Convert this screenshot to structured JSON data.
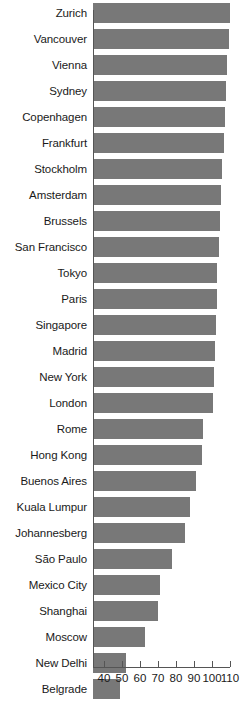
{
  "chart_data": {
    "type": "bar",
    "orientation": "horizontal",
    "title": "",
    "subtitle": "",
    "xlabel": "",
    "ylabel": "",
    "xlim": [
      40,
      110
    ],
    "xticks": [
      40,
      50,
      60,
      70,
      80,
      90,
      100,
      110
    ],
    "xtick_labels": [
      "40",
      "50",
      "60",
      "70",
      "80",
      "90",
      "100",
      "110"
    ],
    "grid": false,
    "legend": null,
    "bar_color": "#787878",
    "axis_color": "#555555",
    "categories": [
      "Zurich",
      "Vancouver",
      "Vienna",
      "Sydney",
      "Copenhagen",
      "Frankfurt",
      "Stockholm",
      "Amsterdam",
      "Brussels",
      "San Francisco",
      "Tokyo",
      "Paris",
      "Singapore",
      "Madrid",
      "New York",
      "London",
      "Rome",
      "Hong Kong",
      "Buenos Aires",
      "Kuala Lumpur",
      "Johannesberg",
      "São Paulo",
      "Mexico City",
      "Shanghai",
      "Moscow",
      "New Delhi",
      "Belgrade"
    ],
    "values": [
      110.0,
      109.5,
      108.5,
      107.5,
      107.0,
      106.5,
      105.5,
      105.0,
      104.5,
      104.0,
      103.0,
      102.5,
      102.0,
      101.5,
      101.0,
      100.5,
      95.0,
      94.5,
      91.0,
      88.0,
      85.0,
      78.0,
      71.0,
      70.0,
      63.0,
      52.0,
      49.0
    ]
  }
}
